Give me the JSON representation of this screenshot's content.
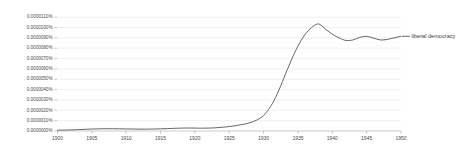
{
  "chart_data": {
    "type": "line",
    "title": "",
    "subtitle": "",
    "xlabel": "",
    "ylabel": "",
    "grid": true,
    "legend_position": "right-inline",
    "xlim": [
      1900,
      1950
    ],
    "ylim": [
      0.0,
      1.15e-05
    ],
    "x_ticks": [
      1900,
      1905,
      1910,
      1915,
      1920,
      1925,
      1930,
      1935,
      1940,
      1945,
      1950
    ],
    "x_tick_labels": [
      "1900",
      "1905",
      "1910",
      "1915",
      "1920",
      "1925",
      "1930",
      "1935",
      "1940",
      "1945",
      "1950"
    ],
    "y_ticks": [
      0.0,
      1e-06,
      2e-06,
      3e-06,
      4e-06,
      5e-06,
      6e-06,
      7e-06,
      8e-06,
      9e-06,
      1e-05,
      1.1e-05
    ],
    "y_tick_labels": [
      "0.0000000%",
      "0.0000010%",
      "0.0000020%",
      "0.0000030%",
      "0.0000040%",
      "0.0000050%",
      "0.0000060%",
      "0.0000070%",
      "0.0000080%",
      "0.0000090%",
      "0.0000100%",
      "0.0000110%"
    ],
    "series": [
      {
        "name": "liberal democracy",
        "color": "#555555",
        "x": [
          1900,
          1901,
          1902,
          1903,
          1904,
          1905,
          1906,
          1907,
          1908,
          1909,
          1910,
          1911,
          1912,
          1913,
          1914,
          1915,
          1916,
          1917,
          1918,
          1919,
          1920,
          1921,
          1922,
          1923,
          1924,
          1925,
          1926,
          1927,
          1928,
          1929,
          1930,
          1931,
          1932,
          1933,
          1934,
          1935,
          1936,
          1937,
          1938,
          1939,
          1940,
          1941,
          1942,
          1943,
          1944,
          1945,
          1946,
          1947,
          1948,
          1949,
          1950
        ],
        "values": [
          8e-08,
          9e-08,
          1.1e-07,
          1.3e-07,
          1.6e-07,
          1.9e-07,
          2.1e-07,
          2.2e-07,
          2.2e-07,
          2.1e-07,
          2e-07,
          1.9e-07,
          1.8e-07,
          1.8e-07,
          1.9e-07,
          2.1e-07,
          2.3e-07,
          2.6e-07,
          2.8e-07,
          2.9e-07,
          2.8e-07,
          2.7e-07,
          2.8e-07,
          3.1e-07,
          3.6e-07,
          4.3e-07,
          5.2e-07,
          6.4e-07,
          8e-07,
          1.05e-06,
          1.5e-06,
          2.35e-06,
          3.6e-06,
          5.2e-06,
          6.8e-06,
          8.2e-06,
          9.3e-06,
          1e-05,
          1.035e-05,
          9.85e-06,
          9.35e-06,
          9e-06,
          8.75e-06,
          8.8e-06,
          9.05e-06,
          9.15e-06,
          8.98e-06,
          8.8e-06,
          8.85e-06,
          9e-06,
          9.15e-06
        ]
      }
    ]
  },
  "legend": {
    "entries": [
      {
        "label": "liberal democracy",
        "color": "#555555"
      }
    ]
  },
  "axes": {
    "y_axis_name": "relative frequency percent",
    "x_axis_name": "year"
  }
}
